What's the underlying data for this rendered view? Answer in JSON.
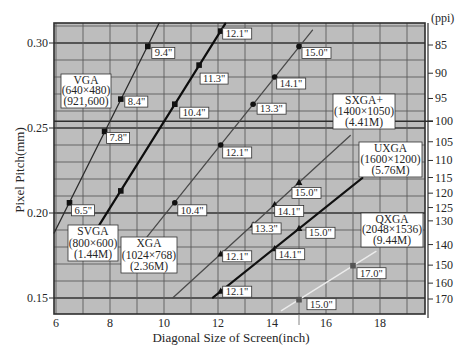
{
  "chart_data": {
    "type": "line",
    "title": "",
    "xlabel": "Diagonal Size of Screen(inch)",
    "ylabel": "Pixel Pitch(mm)",
    "y2label": "(ppi)",
    "xlim": [
      5.93,
      19.67
    ],
    "ylim": [
      0.141,
      0.312
    ],
    "grid": true,
    "legend_position": "inline boxes next to each line",
    "xticks": [
      {
        "value": 6,
        "label": "6"
      },
      {
        "value": 8,
        "label": "8"
      },
      {
        "value": 10,
        "label": "10"
      },
      {
        "value": 12,
        "label": "12"
      },
      {
        "value": 14,
        "label": "14"
      },
      {
        "value": 16,
        "label": "16"
      },
      {
        "value": 18,
        "label": "18"
      }
    ],
    "yticks": [
      {
        "value": 0.15,
        "label": "0.15"
      },
      {
        "value": 0.2,
        "label": "0.20"
      },
      {
        "value": 0.25,
        "label": "0.25"
      },
      {
        "value": 0.3,
        "label": "0.30"
      }
    ],
    "y2ticks": [
      {
        "ppi": 85,
        "label": "85"
      },
      {
        "ppi": 90,
        "label": "90"
      },
      {
        "ppi": 95,
        "label": "95"
      },
      {
        "ppi": 100,
        "label": "100"
      },
      {
        "ppi": 105,
        "label": "105"
      },
      {
        "ppi": 110,
        "label": "110"
      },
      {
        "ppi": 115,
        "label": "115"
      },
      {
        "ppi": 120,
        "label": "120"
      },
      {
        "ppi": 125,
        "label": "125"
      },
      {
        "ppi": 130,
        "label": "130"
      },
      {
        "ppi": 140,
        "label": "140"
      },
      {
        "ppi": 150,
        "label": "150"
      },
      {
        "ppi": 160,
        "label": "160"
      },
      {
        "ppi": 170,
        "label": "170"
      }
    ],
    "reference_lines": [
      {
        "axis": "y2",
        "ppi": 100,
        "color": "#2e2e2e"
      }
    ],
    "colors": {
      "plot_background": "#bdbdbd",
      "grid": "#5c5c5c",
      "grid_major": "#333333",
      "label_box": "#ffffff",
      "label_border": "#333333"
    },
    "series": [
      {
        "name": "VGA",
        "resolution": "(640×480)",
        "pixel_count": "(921,600)",
        "color": "#2b2b2b",
        "line_width": 1.3,
        "marker": "square",
        "marker_color": "#111111",
        "line_range": [
          5.93,
          9.82
        ],
        "points": [
          {
            "x": 6.5,
            "y": 0.206,
            "label": "6.5\""
          },
          {
            "x": 7.8,
            "y": 0.248,
            "label": "7.8\""
          },
          {
            "x": 8.4,
            "y": 0.267,
            "label": "8.4\""
          },
          {
            "x": 9.4,
            "y": 0.298,
            "label": "9.4\""
          }
        ]
      },
      {
        "name": "SVGA",
        "resolution": "(800×600)",
        "pixel_count": "(1.44M)",
        "color": "#0d0d0d",
        "line_width": 2.2,
        "marker": "square",
        "marker_color": "#111111",
        "line_range": [
          7.6,
          12.27
        ],
        "points": [
          {
            "x": 8.4,
            "y": 0.213,
            "label": ""
          },
          {
            "x": 10.4,
            "y": 0.264,
            "label": "10.4\""
          },
          {
            "x": 11.3,
            "y": 0.287,
            "label": "11.3\""
          },
          {
            "x": 12.1,
            "y": 0.307,
            "label": "12.1\""
          }
        ]
      },
      {
        "name": "XGA",
        "resolution": "(1024×768)",
        "pixel_count": "(2.36M)",
        "color": "#4a4a4a",
        "line_width": 1.3,
        "marker": "circle",
        "marker_color": "#111111",
        "line_range": [
          9.37,
          15.5
        ],
        "points": [
          {
            "x": 10.4,
            "y": 0.206,
            "label": "10.4\""
          },
          {
            "x": 12.1,
            "y": 0.24,
            "label": "12.1\""
          },
          {
            "x": 13.3,
            "y": 0.264,
            "label": "13.3\""
          },
          {
            "x": 14.1,
            "y": 0.28,
            "label": "14.1\""
          },
          {
            "x": 15.0,
            "y": 0.298,
            "label": "15.0\""
          }
        ]
      },
      {
        "name": "SXGA+",
        "resolution": "(1400×1050)",
        "pixel_count": "(4.41M)",
        "color": "#4a4a4a",
        "line_width": 1.3,
        "marker": "triangle",
        "marker_color": "#111111",
        "line_range": [
          10.33,
          16.9
        ],
        "points": [
          {
            "x": 12.1,
            "y": 0.176,
            "label": "12.1\""
          },
          {
            "x": 13.3,
            "y": 0.193,
            "label": "13.3\""
          },
          {
            "x": 14.1,
            "y": 0.205,
            "label": "14.1\""
          },
          {
            "x": 15.0,
            "y": 0.218,
            "label": "15.0\""
          }
        ]
      },
      {
        "name": "UXGA",
        "resolution": "(1600×1200)",
        "pixel_count": "(5.76M)",
        "color": "#111111",
        "line_width": 2.0,
        "marker": "triangle",
        "marker_color": "#111111",
        "line_range": [
          11.81,
          17.35
        ],
        "points": [
          {
            "x": 12.1,
            "y": 0.154,
            "label": "12.1\""
          },
          {
            "x": 14.1,
            "y": 0.179,
            "label": "14.1\""
          },
          {
            "x": 15.0,
            "y": 0.191,
            "label": "15.0\""
          }
        ]
      },
      {
        "name": "QXGA",
        "resolution": "(2048×1536)",
        "pixel_count": "(9.44M)",
        "color": "#ececec",
        "line_width": 1.4,
        "marker": "square",
        "marker_color": "#555555",
        "line_range": [
          14.35,
          17.85
        ],
        "points": [
          {
            "x": 15.0,
            "y": 0.149,
            "label": "15.0\""
          },
          {
            "x": 17.0,
            "y": 0.169,
            "label": "17.0\""
          }
        ]
      }
    ]
  }
}
